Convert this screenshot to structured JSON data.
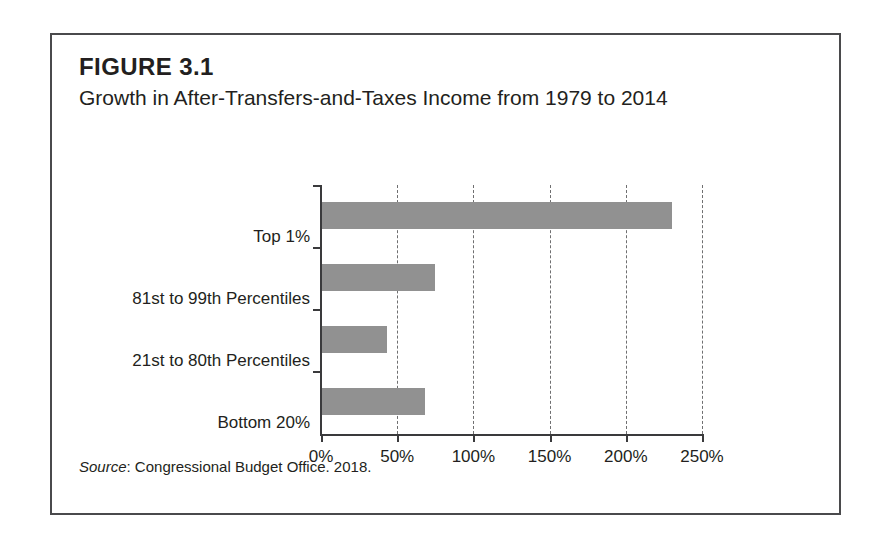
{
  "figure": {
    "number": "FIGURE 3.1",
    "title": "Growth in After-Transfers-and-Taxes Income from 1979 to 2014",
    "source_word": "Source",
    "source_rest": ": Congressional Budget Office. 2018.",
    "frame_color": "#4a4a4c"
  },
  "chart_data": {
    "type": "bar",
    "orientation": "horizontal",
    "title": "Growth in After-Transfers-and-Taxes Income from 1979 to 2014",
    "subtitle": "",
    "categories": [
      "Top 1%",
      "81st to 99th Percentiles",
      "21st to 80th Percentiles",
      "Bottom 20%"
    ],
    "values": [
      230,
      75,
      43,
      68
    ],
    "value_unit": "%",
    "xlabel": "",
    "ylabel": "",
    "xlim": [
      0,
      250
    ],
    "xticks": [
      0,
      50,
      100,
      150,
      200,
      250
    ],
    "xtick_labels": [
      "0%",
      "50%",
      "100%",
      "150%",
      "200%",
      "250%"
    ],
    "grid": "vertical-dashed",
    "legend": "none",
    "bar_color": "#919191",
    "axis_color": "#3a3a3c",
    "gridline_color": "#6f6f70"
  }
}
